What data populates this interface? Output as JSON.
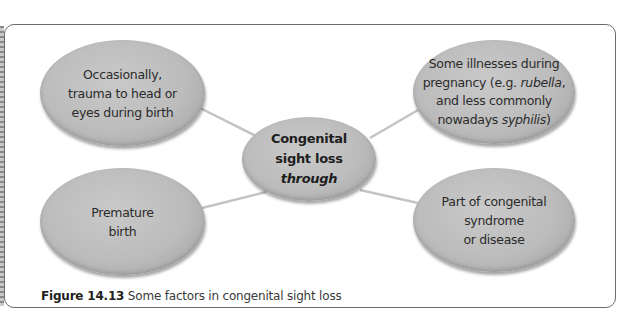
{
  "diagram": {
    "type": "mind-map",
    "center": {
      "lines": [
        "Congenital",
        "sight loss"
      ],
      "italic_line": "through"
    },
    "nodes": [
      {
        "id": "top-left",
        "lines": [
          "Occasionally,",
          "trauma to head or",
          "eyes during birth"
        ]
      },
      {
        "id": "top-right",
        "line1": "Some illnesses during",
        "line2_pre": "pregnancy (e.g. ",
        "line2_italic": "rubella",
        "line2_post": ",",
        "line3": "and less commonly",
        "line4_pre": "nowadays ",
        "line4_italic": "syphilis",
        "line4_post": ")"
      },
      {
        "id": "bottom-left",
        "lines": [
          "Premature",
          "birth"
        ]
      },
      {
        "id": "bottom-right",
        "lines": [
          "Part of congenital",
          "syndrome",
          "or disease"
        ]
      }
    ],
    "colors": {
      "node_fill": "#bcbcbc",
      "connector": "#c4c4c4",
      "frame_border": "#6b6b6b"
    }
  },
  "caption": {
    "label": "Figure 14.13",
    "text": " Some factors in congenital sight loss"
  }
}
